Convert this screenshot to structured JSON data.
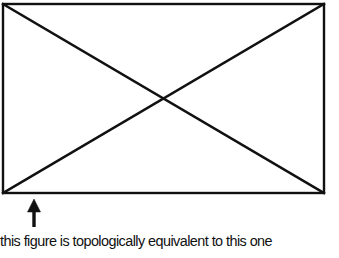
{
  "figure": {
    "shape": "rectangle-with-diagonals",
    "rectangle": {
      "x1": 3,
      "y1": 4,
      "x2": 324,
      "y2": 193
    },
    "stroke_color": "#111111",
    "arrow": {
      "direction": "up",
      "x": 34,
      "tip_y": 200,
      "tail_y": 227,
      "icon": "arrow-up-icon"
    }
  },
  "caption": {
    "text": "this figure is topologically equivalent to this one"
  }
}
